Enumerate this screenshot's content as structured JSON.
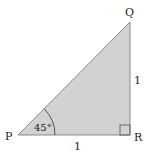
{
  "diagram": {
    "type": "right-triangle",
    "vertices": {
      "P": {
        "label": "P",
        "x": 18,
        "y": 135
      },
      "Q": {
        "label": "Q",
        "x": 130,
        "y": 22
      },
      "R": {
        "label": "R",
        "x": 130,
        "y": 135
      }
    },
    "side_labels": {
      "QR": "1",
      "PR": "1"
    },
    "angle_label": "45°",
    "right_angle_at": "R",
    "colors": {
      "fill": "#cfcfcf",
      "stroke": "#888888",
      "text": "#222222"
    }
  }
}
